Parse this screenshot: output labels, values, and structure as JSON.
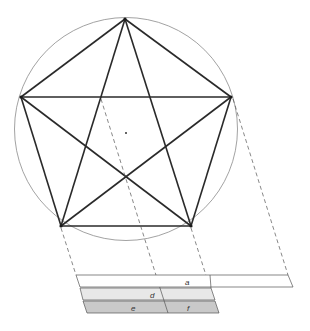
{
  "figure": {
    "type": "pentagon-pentagram-golden-ratio-diagram",
    "center_marker": "center-dot",
    "colors": {
      "circle": "#8a8a8a",
      "edges": "#2a2a2a",
      "projection": "#555555",
      "bar_a_fill": "#ffffff",
      "bar_d_fill": "#e8e8e8",
      "bar_ef_fill": "#c9c9c9",
      "bar_stroke": "#555555"
    },
    "bars": [
      {
        "id": "a",
        "label": "a"
      },
      {
        "id": "d",
        "label": "d"
      },
      {
        "id": "e",
        "label": "e"
      },
      {
        "id": "f",
        "label": "f"
      }
    ]
  }
}
